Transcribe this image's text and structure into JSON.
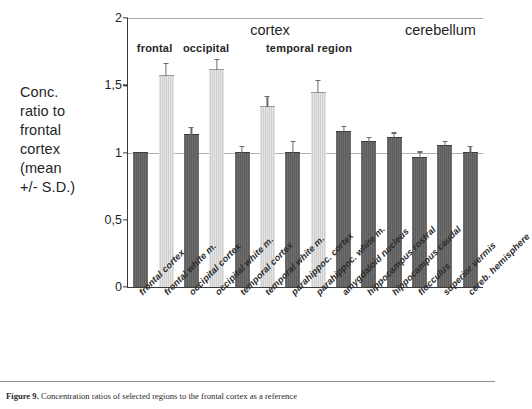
{
  "chart_data": {
    "type": "bar",
    "title": "",
    "xlabel": "",
    "ylabel": "Conc. ratio to frontal cortex (mean +/- S.D.)",
    "ylim": [
      0,
      2
    ],
    "ytick_labels": [
      "0",
      "0,5",
      "1",
      "1,5",
      "2"
    ],
    "ytick_values": [
      0,
      0.5,
      1,
      1.5,
      2
    ],
    "grid": "horizontal rules at 1 and 2 only",
    "legend": "none",
    "categories": [
      "frontal cortex",
      "frontal white m.",
      "occipital cortex",
      "occipital white m.",
      "temporal cortex",
      "temporal white m.",
      "parahippoc. cortex",
      "parahippoc. white m.",
      "amygdaloid nucleus",
      "hippocampus rostral",
      "hippocampus caudal",
      "flocculus",
      "superior vermis",
      "cereb. hemisphere"
    ],
    "values": [
      1.0,
      1.57,
      1.13,
      1.61,
      1.0,
      1.34,
      1.0,
      1.44,
      1.15,
      1.08,
      1.11,
      0.96,
      1.05,
      1.0
    ],
    "errors": [
      0.0,
      0.09,
      0.05,
      0.08,
      0.04,
      0.07,
      0.08,
      0.09,
      0.04,
      0.03,
      0.03,
      0.04,
      0.03,
      0.04
    ],
    "bar_shades": [
      "dark",
      "light",
      "dark",
      "light",
      "dark",
      "light",
      "dark",
      "light",
      "dark",
      "dark",
      "dark",
      "dark",
      "dark",
      "dark"
    ],
    "group_headers": {
      "major": [
        {
          "label": "cortex",
          "center_pct": 40
        },
        {
          "label": "cerebellum",
          "center_pct": 88
        }
      ],
      "minor": [
        {
          "label": "frontal",
          "center_pct": 7.5
        },
        {
          "label": "occipital",
          "center_pct": 22
        },
        {
          "label": "temporal region",
          "center_pct": 51
        }
      ]
    }
  },
  "axis": {
    "value_2": "2",
    "value_1_5": "1,5",
    "value_1": "1",
    "value_0_5": "0,5",
    "value_0": "0"
  },
  "y_title_lines": [
    "Conc.",
    "ratio to",
    "frontal",
    "cortex",
    "(mean",
    "+/- S.D.)"
  ],
  "caption": {
    "figure_number": "Figure 9.",
    "text": "Concentration ratios of selected regions to the frontal cortex as a reference"
  }
}
